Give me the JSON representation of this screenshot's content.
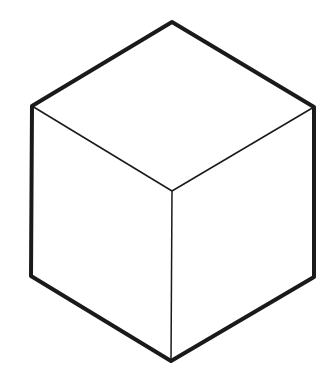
{
  "diagram": {
    "stroke_color": "#1a1a1a",
    "background": "#ffffff",
    "outer_stroke_width": 4,
    "inner_stroke_width": 1.5,
    "vertices": {
      "top": [
        172,
        22
      ],
      "upper_left": [
        32,
        106
      ],
      "upper_right": [
        314,
        107
      ],
      "lower_left": [
        31,
        276
      ],
      "lower_right": [
        314,
        277
      ],
      "bottom": [
        171,
        361
      ],
      "center": [
        172,
        191
      ]
    }
  }
}
